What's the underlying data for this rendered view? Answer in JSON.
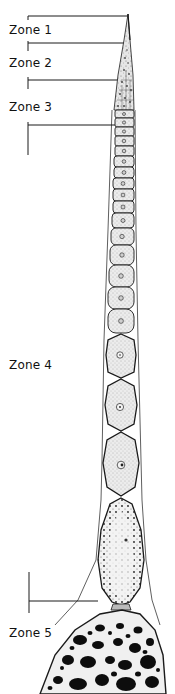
{
  "figure": {
    "type": "biological-illustration"
  },
  "zones": [
    {
      "label": "Zone 1",
      "label_y": 23
    },
    {
      "label": "Zone 2",
      "label_y": 56
    },
    {
      "label": "Zone 3",
      "label_y": 100
    },
    {
      "label": "Zone 4",
      "label_y": 358
    },
    {
      "label": "Zone 5",
      "label_y": 626
    }
  ],
  "colors": {
    "ink": "#1a1a1a",
    "stipple": "#d4d4d4",
    "background": "#ffffff"
  }
}
